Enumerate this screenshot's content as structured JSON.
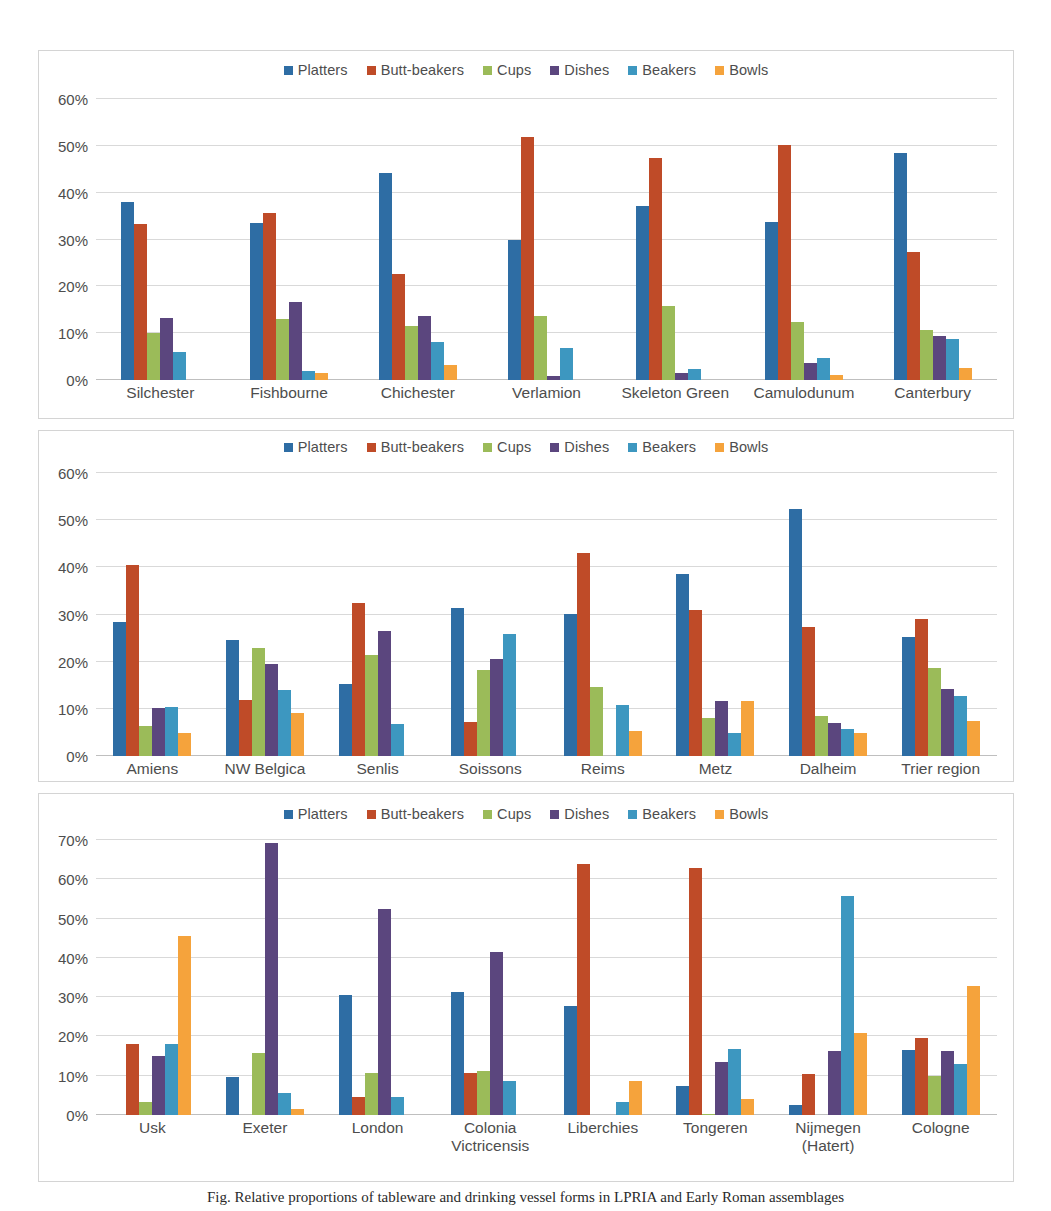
{
  "palette": {
    "platters": "#2E6DA4",
    "butt_beakers": "#BF4B28",
    "cups": "#9BBB59",
    "dishes": "#5B467E",
    "beakers": "#3D97C0",
    "bowls": "#F5A33C",
    "gridline": "#d9d9d9",
    "axis_text": "#4d4d4d",
    "border": "#d4d4d4"
  },
  "series_names": [
    "Platters",
    "Butt-beakers",
    "Cups",
    "Dishes",
    "Beakers",
    "Bowls"
  ],
  "legend": {
    "items": [
      {
        "label": "Platters",
        "color": "#2E6DA4",
        "icon": "legend-swatch-square"
      },
      {
        "label": "Butt-beakers",
        "color": "#BF4B28",
        "icon": "legend-swatch-square"
      },
      {
        "label": "Cups",
        "color": "#9BBB59",
        "icon": "legend-swatch-square"
      },
      {
        "label": "Dishes",
        "color": "#5B467E",
        "icon": "legend-swatch-square"
      },
      {
        "label": "Beakers",
        "color": "#3D97C0",
        "icon": "legend-swatch-square"
      },
      {
        "label": "Bowls",
        "color": "#F5A33C",
        "icon": "legend-swatch-square"
      }
    ]
  },
  "caption": {
    "text": "Fig.  Relative proportions of tableware and drinking vessel forms in LPRIA and Early Roman assemblages"
  },
  "chart_data": [
    {
      "id": "chart1",
      "type": "bar",
      "title": "",
      "xlabel": "",
      "ylabel": "",
      "ylim": [
        0,
        60
      ],
      "ytick_values": [
        0,
        10,
        20,
        30,
        40,
        50,
        60
      ],
      "ytick_labels": [
        "0%",
        "10%",
        "20%",
        "30%",
        "40%",
        "50%",
        "60%"
      ],
      "grid": true,
      "legend_position": "top-center",
      "categories": [
        "Silchester",
        "Fishbourne",
        "Chichester",
        "Verlamion",
        "Skeleton Green",
        "Camulodunum",
        "Canterbury"
      ],
      "series": [
        {
          "name": "Platters",
          "color": "#2E6DA4",
          "values": [
            38.0,
            33.5,
            44.3,
            29.8,
            37.2,
            33.8,
            48.5
          ]
        },
        {
          "name": "Butt-beakers",
          "color": "#BF4B28",
          "values": [
            33.4,
            35.6,
            22.6,
            51.8,
            47.4,
            50.1,
            27.3
          ]
        },
        {
          "name": "Cups",
          "color": "#9BBB59",
          "values": [
            10.0,
            13.0,
            11.6,
            13.7,
            15.9,
            12.3,
            10.6
          ]
        },
        {
          "name": "Dishes",
          "color": "#5B467E",
          "values": [
            13.2,
            16.6,
            13.6,
            0.8,
            1.4,
            3.6,
            9.4
          ]
        },
        {
          "name": "Beakers",
          "color": "#3D97C0",
          "values": [
            6.0,
            2.0,
            8.1,
            6.8,
            2.3,
            4.8,
            8.7
          ]
        },
        {
          "name": "Bowls",
          "color": "#F5A33C",
          "values": [
            0.0,
            1.4,
            3.2,
            0.0,
            0.0,
            1.1,
            2.6
          ]
        }
      ]
    },
    {
      "id": "chart2",
      "type": "bar",
      "title": "",
      "xlabel": "",
      "ylabel": "",
      "ylim": [
        0,
        60
      ],
      "ytick_values": [
        0,
        10,
        20,
        30,
        40,
        50,
        60
      ],
      "ytick_labels": [
        "0%",
        "10%",
        "20%",
        "30%",
        "40%",
        "50%",
        "60%"
      ],
      "grid": true,
      "legend_position": "top-center",
      "categories": [
        "Amiens",
        "NW Belgica",
        "Senlis",
        "Soissons",
        "Reims",
        "Metz",
        "Dalheim",
        "Trier region"
      ],
      "series": [
        {
          "name": "Platters",
          "color": "#2E6DA4",
          "values": [
            28.4,
            24.6,
            15.3,
            31.3,
            30.2,
            38.6,
            52.3,
            25.2
          ]
        },
        {
          "name": "Butt-beakers",
          "color": "#BF4B28",
          "values": [
            40.5,
            11.9,
            32.5,
            7.2,
            43.1,
            31.0,
            27.4,
            29.1
          ]
        },
        {
          "name": "Cups",
          "color": "#9BBB59",
          "values": [
            6.4,
            22.8,
            21.5,
            18.2,
            14.6,
            8.0,
            8.4,
            18.7
          ]
        },
        {
          "name": "Dishes",
          "color": "#5B467E",
          "values": [
            10.1,
            19.5,
            26.5,
            20.5,
            0.0,
            11.6,
            7.1,
            14.3
          ]
        },
        {
          "name": "Beakers",
          "color": "#3D97C0",
          "values": [
            10.4,
            14.0,
            6.7,
            25.9,
            10.8,
            4.9,
            5.8,
            12.7
          ]
        },
        {
          "name": "Bowls",
          "color": "#F5A33C",
          "values": [
            4.8,
            9.2,
            0.0,
            0.0,
            5.3,
            11.6,
            4.8,
            7.5
          ]
        }
      ]
    },
    {
      "id": "chart3",
      "type": "bar",
      "title": "",
      "xlabel": "",
      "ylabel": "",
      "ylim": [
        0,
        70
      ],
      "ytick_values": [
        0,
        10,
        20,
        30,
        40,
        50,
        60,
        70
      ],
      "ytick_labels": [
        "0%",
        "10%",
        "20%",
        "30%",
        "40%",
        "50%",
        "60%",
        "70%"
      ],
      "grid": true,
      "legend_position": "top-center",
      "categories": [
        "Usk",
        "Exeter",
        "London",
        "Colonia\nVictricensis",
        "Liberchies",
        "Tongeren",
        "Nijmegen\n(Hatert)",
        "Cologne"
      ],
      "series": [
        {
          "name": "Platters",
          "color": "#2E6DA4",
          "values": [
            0.0,
            9.6,
            30.5,
            31.3,
            27.8,
            7.4,
            2.6,
            16.5
          ]
        },
        {
          "name": "Butt-beakers",
          "color": "#BF4B28",
          "values": [
            18.2,
            0.0,
            4.6,
            10.6,
            63.9,
            62.8,
            10.5,
            19.6
          ]
        },
        {
          "name": "Cups",
          "color": "#9BBB59",
          "values": [
            3.3,
            15.9,
            10.6,
            11.3,
            0.0,
            0.3,
            0.0,
            10.0
          ]
        },
        {
          "name": "Dishes",
          "color": "#5B467E",
          "values": [
            15.1,
            69.2,
            52.4,
            41.4,
            0.0,
            13.4,
            16.2,
            16.3
          ]
        },
        {
          "name": "Beakers",
          "color": "#3D97C0",
          "values": [
            18.2,
            5.6,
            4.7,
            8.6,
            3.3,
            16.8,
            55.8,
            13.0
          ]
        },
        {
          "name": "Bowls",
          "color": "#F5A33C",
          "values": [
            45.5,
            1.5,
            0.0,
            0.0,
            8.6,
            4.1,
            21.0,
            32.9
          ]
        }
      ]
    }
  ]
}
